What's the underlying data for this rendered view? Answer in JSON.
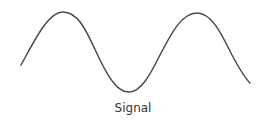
{
  "diagram": {
    "label": "Signal",
    "stroke_color": "#4a4a4a",
    "waveform": "sine",
    "start": [
      21,
      65
    ],
    "peaks": [
      [
        63,
        12
      ],
      [
        197,
        13
      ]
    ],
    "troughs": [
      [
        129,
        92
      ]
    ],
    "end": [
      250,
      83
    ]
  }
}
